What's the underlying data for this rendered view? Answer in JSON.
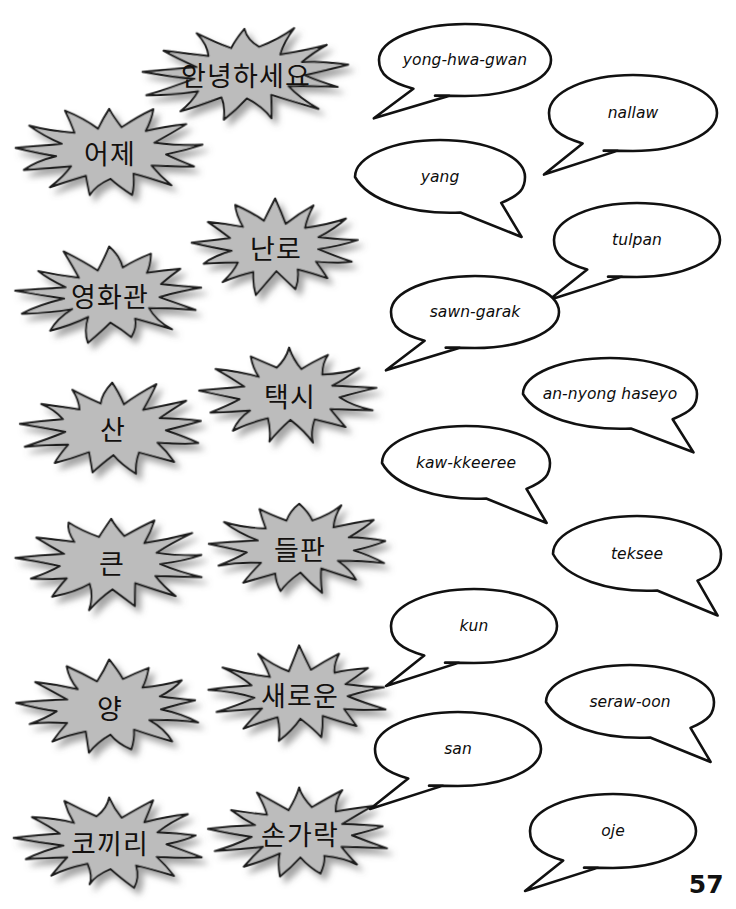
{
  "page": {
    "number": "57",
    "background_color": "#ffffff",
    "burst_fill_color": "#bcbcbc",
    "burst_stroke_color": "#1a1a1a",
    "bubble_fill_color": "#ffffff",
    "bubble_stroke_color": "#111111"
  },
  "korean_bursts": [
    {
      "text": "안녕하세요",
      "cx": 246,
      "cy": 74,
      "rx": 101,
      "ry": 47,
      "font_size": 27,
      "rot": -2
    },
    {
      "text": "어제",
      "cx": 110,
      "cy": 152,
      "rx": 92,
      "ry": 46,
      "font_size": 27,
      "rot": -1
    },
    {
      "text": "난로",
      "cx": 276,
      "cy": 247,
      "rx": 82,
      "ry": 46,
      "font_size": 27,
      "rot": -1
    },
    {
      "text": "영화관",
      "cx": 110,
      "cy": 295,
      "rx": 92,
      "ry": 47,
      "font_size": 27,
      "rot": -1
    },
    {
      "text": "택시",
      "cx": 290,
      "cy": 395,
      "rx": 88,
      "ry": 47,
      "font_size": 27,
      "rot": -1
    },
    {
      "text": "산",
      "cx": 113,
      "cy": 428,
      "rx": 90,
      "ry": 46,
      "font_size": 27,
      "rot": -1
    },
    {
      "text": "들판",
      "cx": 300,
      "cy": 548,
      "rx": 88,
      "ry": 46,
      "font_size": 27,
      "rot": -1
    },
    {
      "text": "큰",
      "cx": 112,
      "cy": 562,
      "rx": 93,
      "ry": 46,
      "font_size": 27,
      "rot": -1
    },
    {
      "text": "새로운",
      "cx": 300,
      "cy": 694,
      "rx": 88,
      "ry": 46,
      "font_size": 27,
      "rot": -1
    },
    {
      "text": "양",
      "cx": 110,
      "cy": 707,
      "rx": 90,
      "ry": 46,
      "font_size": 27,
      "rot": -1
    },
    {
      "text": "손가락",
      "cx": 300,
      "cy": 833,
      "rx": 88,
      "ry": 45,
      "font_size": 27,
      "rot": -1
    },
    {
      "text": "코끼리",
      "cx": 110,
      "cy": 842,
      "rx": 92,
      "ry": 45,
      "font_size": 27,
      "rot": -1
    }
  ],
  "romanization_bubbles": [
    {
      "text": "yong-hwa-gwan",
      "cx": 465,
      "cy": 60,
      "rx": 86,
      "ry": 36,
      "tail": "down-left"
    },
    {
      "text": "nallaw",
      "cx": 633,
      "cy": 113,
      "rx": 84,
      "ry": 38,
      "tail": "down-left"
    },
    {
      "text": "yang",
      "cx": 440,
      "cy": 177,
      "rx": 85,
      "ry": 37,
      "tail": "down-right"
    },
    {
      "text": "tulpan",
      "cx": 637,
      "cy": 240,
      "rx": 83,
      "ry": 37,
      "tail": "down-left"
    },
    {
      "text": "sawn-garak",
      "cx": 475,
      "cy": 312,
      "rx": 84,
      "ry": 36,
      "tail": "down-left"
    },
    {
      "text": "an-nyong haseyo",
      "cx": 610,
      "cy": 394,
      "rx": 87,
      "ry": 36,
      "tail": "down-right"
    },
    {
      "text": "kaw-kkeeree",
      "cx": 466,
      "cy": 463,
      "rx": 84,
      "ry": 37,
      "tail": "down-right"
    },
    {
      "text": "teksee",
      "cx": 637,
      "cy": 554,
      "rx": 84,
      "ry": 38,
      "tail": "down-right"
    },
    {
      "text": "kun",
      "cx": 474,
      "cy": 626,
      "rx": 83,
      "ry": 37,
      "tail": "down-left"
    },
    {
      "text": "seraw-oon",
      "cx": 630,
      "cy": 702,
      "rx": 84,
      "ry": 37,
      "tail": "down-right"
    },
    {
      "text": "san",
      "cx": 458,
      "cy": 749,
      "rx": 83,
      "ry": 37,
      "tail": "down-left"
    },
    {
      "text": "oje",
      "cx": 613,
      "cy": 831,
      "rx": 83,
      "ry": 37,
      "tail": "down-left"
    }
  ]
}
